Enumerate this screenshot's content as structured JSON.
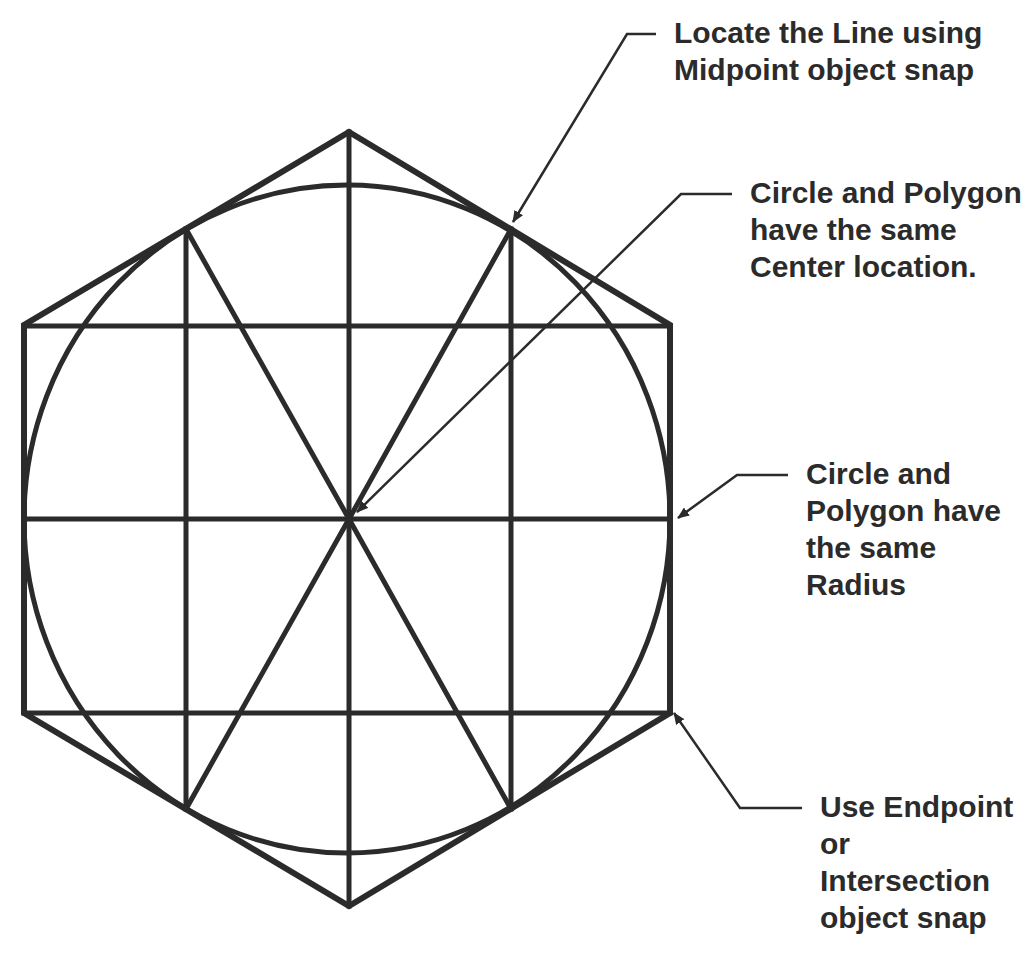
{
  "diagram": {
    "type": "cad-construction-figure",
    "colors": {
      "stroke": "#2b2b2b",
      "text": "#2b2b2b",
      "background": "#ffffff"
    },
    "shapes": {
      "hexagon": {
        "vertices": [
          [
            349,
            132
          ],
          [
            670,
            325
          ],
          [
            670,
            713
          ],
          [
            349,
            906
          ],
          [
            24,
            713
          ],
          [
            24,
            325
          ]
        ],
        "stroke_width": 6
      },
      "circle": {
        "cx": 347,
        "cy": 519,
        "rx": 323,
        "ry": 334,
        "stroke_width": 5
      },
      "construction_lines": [
        {
          "name": "vertical-center-line",
          "x1": 349,
          "y1": 132,
          "x2": 349,
          "y2": 906
        },
        {
          "name": "horizontal-center-line",
          "x1": 24,
          "y1": 519,
          "x2": 670,
          "y2": 519
        },
        {
          "name": "upper-horizontal-line",
          "x1": 24,
          "y1": 326,
          "x2": 670,
          "y2": 326
        },
        {
          "name": "lower-horizontal-line",
          "x1": 24,
          "y1": 713,
          "x2": 670,
          "y2": 713
        },
        {
          "name": "left-vertical-line",
          "x1": 186,
          "y1": 229,
          "x2": 186,
          "y2": 809
        },
        {
          "name": "right-vertical-line",
          "x1": 511,
          "y1": 229,
          "x2": 511,
          "y2": 809
        },
        {
          "name": "diagonal-upper-left",
          "x1": 186,
          "y1": 229,
          "x2": 349,
          "y2": 519
        },
        {
          "name": "diagonal-upper-right",
          "x1": 511,
          "y1": 229,
          "x2": 349,
          "y2": 519
        },
        {
          "name": "diagonal-lower-left",
          "x1": 186,
          "y1": 809,
          "x2": 349,
          "y2": 519
        },
        {
          "name": "diagonal-lower-right",
          "x1": 511,
          "y1": 809,
          "x2": 349,
          "y2": 519
        }
      ]
    },
    "callouts": [
      {
        "id": "midpoint",
        "lines": [
          "Locate the Line using",
          "Midpoint object snap"
        ],
        "text_x": 674,
        "text_y": 14,
        "leader": [
          [
            656,
            34
          ],
          [
            627,
            34
          ],
          [
            513,
            222
          ]
        ]
      },
      {
        "id": "center",
        "lines": [
          "Circle and Polygon",
          "have the same",
          "Center location."
        ],
        "text_x": 750,
        "text_y": 174,
        "leader": [
          [
            732,
            194
          ],
          [
            681,
            194
          ],
          [
            357,
            512
          ]
        ]
      },
      {
        "id": "radius",
        "lines": [
          "Circle and",
          "Polygon have",
          "the same",
          "Radius"
        ],
        "text_x": 806,
        "text_y": 455,
        "leader": [
          [
            788,
            475
          ],
          [
            737,
            475
          ],
          [
            678,
            518
          ]
        ]
      },
      {
        "id": "endpoint",
        "lines": [
          "Use Endpoint",
          "or",
          "Intersection",
          "object snap"
        ],
        "text_x": 820,
        "text_y": 788,
        "leader": [
          [
            802,
            808
          ],
          [
            740,
            808
          ],
          [
            674,
            713
          ]
        ]
      }
    ]
  }
}
